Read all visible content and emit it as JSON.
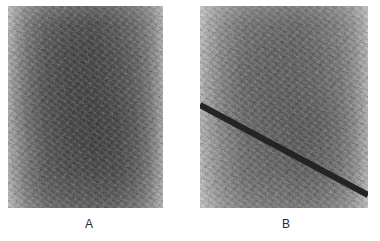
{
  "figure": {
    "background_color": "#ffffff",
    "width": 380,
    "height": 241,
    "panel_count": 2
  },
  "panels": [
    {
      "id": "panel-a",
      "label": "A",
      "description": "uniform grainy grayscale micrograph texture, no defect",
      "has_defect_line": false,
      "geometry": {
        "x": 8,
        "y": 6,
        "width": 155,
        "height": 202
      },
      "tone": {
        "edge_color": "#b4b4b4",
        "center_color": "#4b4b4b",
        "variant": "dark"
      },
      "label_position": {
        "x": 85,
        "y": 218
      }
    },
    {
      "id": "panel-b",
      "label": "B",
      "description": "grainy grayscale micrograph texture crossed by a dark diagonal crack",
      "has_defect_line": true,
      "geometry": {
        "x": 200,
        "y": 6,
        "width": 168,
        "height": 202
      },
      "tone": {
        "edge_color": "#bdbdbd",
        "center_color": "#666666",
        "variant": "light"
      },
      "defect_line": {
        "name": "diagonal-crack",
        "color": "#242424",
        "thickness": 6,
        "start": {
          "x": 0,
          "y": 99
        },
        "end": {
          "x": 168,
          "y": 189
        },
        "slope_description": "descends left to right at about 28 degrees"
      },
      "label_position": {
        "x": 282,
        "y": 218
      }
    }
  ]
}
